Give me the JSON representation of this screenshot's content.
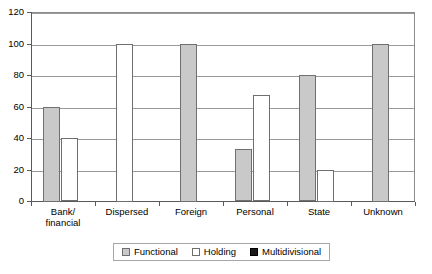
{
  "chart_data": {
    "type": "bar",
    "title": "",
    "xlabel": "",
    "ylabel": "",
    "ylim": [
      0,
      120
    ],
    "yticks": [
      0,
      20,
      40,
      60,
      80,
      100,
      120
    ],
    "grid": true,
    "legend_position": "bottom",
    "categories": [
      "Bank/\nfinancial",
      "Dispersed",
      "Foreign",
      "Personal",
      "State",
      "Unknown"
    ],
    "category_labels": [
      {
        "line1": "Bank/",
        "line2": "financial"
      },
      {
        "line1": "Dispersed",
        "line2": ""
      },
      {
        "line1": "Foreign",
        "line2": ""
      },
      {
        "line1": "Personal",
        "line2": ""
      },
      {
        "line1": "State",
        "line2": ""
      },
      {
        "line1": "Unknown",
        "line2": ""
      }
    ],
    "series": [
      {
        "name": "Functional",
        "color": "#c9c9c9",
        "values": [
          60,
          0,
          100,
          33,
          80,
          100
        ]
      },
      {
        "name": "Holding",
        "color": "#ffffff",
        "values": [
          40,
          100,
          0,
          67,
          20,
          0
        ]
      },
      {
        "name": "Multidivisional",
        "color": "#1a1a1a",
        "values": [
          0,
          0,
          0,
          0,
          0,
          0
        ]
      }
    ]
  },
  "legend": {
    "items": [
      {
        "label": "Functional"
      },
      {
        "label": "Holding"
      },
      {
        "label": "Multidivisional"
      }
    ]
  },
  "axis": {
    "y_tick_labels": [
      "120",
      "100",
      "80",
      "60",
      "40",
      "20",
      "0"
    ]
  }
}
